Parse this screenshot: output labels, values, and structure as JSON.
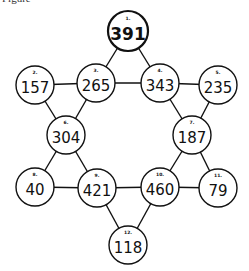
{
  "figure_label": "Figure",
  "nodes": [
    {
      "id": 1,
      "label": "1.",
      "value": "391",
      "x": 128,
      "y": 31,
      "bold": true
    },
    {
      "id": 2,
      "label": "2.",
      "value": "157",
      "x": 35,
      "y": 85
    },
    {
      "id": 3,
      "label": "3.",
      "value": "265",
      "x": 96,
      "y": 83
    },
    {
      "id": 4,
      "label": "4.",
      "value": "343",
      "x": 160,
      "y": 83
    },
    {
      "id": 5,
      "label": "5.",
      "value": "235",
      "x": 218,
      "y": 85
    },
    {
      "id": 6,
      "label": "6.",
      "value": "304",
      "x": 66,
      "y": 135
    },
    {
      "id": 7,
      "label": "7.",
      "value": "187",
      "x": 192,
      "y": 135
    },
    {
      "id": 8,
      "label": "8.",
      "value": "40",
      "x": 35,
      "y": 187
    },
    {
      "id": 9,
      "label": "9.",
      "value": "421",
      "x": 97,
      "y": 188
    },
    {
      "id": 10,
      "label": "10.",
      "value": "460",
      "x": 160,
      "y": 187
    },
    {
      "id": 11,
      "label": "11.",
      "value": "79",
      "x": 218,
      "y": 188
    },
    {
      "id": 12,
      "label": "12.",
      "value": "118",
      "x": 128,
      "y": 245
    }
  ],
  "edges": [
    [
      1,
      3
    ],
    [
      1,
      4
    ],
    [
      2,
      3
    ],
    [
      3,
      4
    ],
    [
      4,
      5
    ],
    [
      2,
      6
    ],
    [
      3,
      6
    ],
    [
      4,
      7
    ],
    [
      5,
      7
    ],
    [
      6,
      8
    ],
    [
      6,
      9
    ],
    [
      8,
      9
    ],
    [
      9,
      10
    ],
    [
      10,
      11
    ],
    [
      7,
      10
    ],
    [
      7,
      11
    ],
    [
      9,
      12
    ],
    [
      10,
      12
    ]
  ],
  "style": {
    "stroke": "#111111",
    "background": "#ffffff",
    "radius": 19
  }
}
